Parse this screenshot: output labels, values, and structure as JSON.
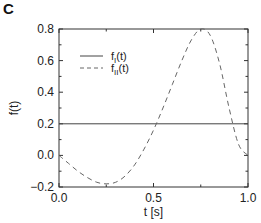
{
  "panel": {
    "letter": "C"
  },
  "chart_data": {
    "type": "line",
    "title": "",
    "xlabel": "t [s]",
    "ylabel": "f(t)",
    "xlim": [
      0.0,
      1.0
    ],
    "ylim": [
      -0.2,
      0.8
    ],
    "xticks": [
      "0.0",
      "0.5",
      "1.0"
    ],
    "yticks": [
      "-0.2",
      "0.0",
      "0.2",
      "0.4",
      "0.6",
      "0.8"
    ],
    "grid": false,
    "legend_position": "upper left",
    "series": [
      {
        "name": "f_I(t)",
        "label_main": "f",
        "label_sub": "I",
        "label_tail": "(t)",
        "style": "solid",
        "x": [
          0.0,
          1.0
        ],
        "y": [
          0.2,
          0.2
        ]
      },
      {
        "name": "f_II(t)",
        "label_main": "f",
        "label_sub": "II",
        "label_tail": "(t)",
        "style": "dashed",
        "x": [
          0.0,
          0.05,
          0.1,
          0.15,
          0.2,
          0.25,
          0.3,
          0.35,
          0.4,
          0.45,
          0.5,
          0.55,
          0.6,
          0.65,
          0.7,
          0.75,
          0.8,
          0.85,
          0.9,
          0.95,
          1.0
        ],
        "y": [
          0.0,
          -0.05,
          -0.1,
          -0.14,
          -0.17,
          -0.18,
          -0.17,
          -0.13,
          -0.06,
          0.04,
          0.16,
          0.3,
          0.45,
          0.6,
          0.73,
          0.8,
          0.76,
          0.58,
          0.3,
          0.07,
          0.0
        ]
      }
    ]
  }
}
